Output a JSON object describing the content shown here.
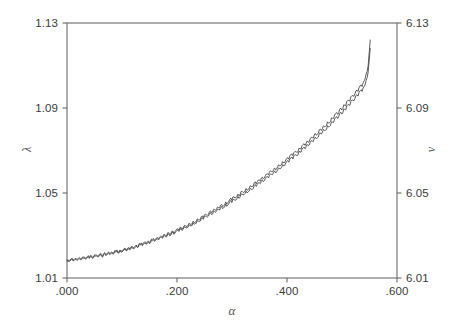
{
  "chart_data": {
    "type": "line",
    "title": "",
    "subtitle": "",
    "xlabel": "α",
    "ylabel": "λ",
    "ylabel_right": "ν",
    "xlim": [
      0.0,
      0.6
    ],
    "ylim": [
      1.01,
      1.13
    ],
    "ylim_right": [
      6.01,
      6.13
    ],
    "xticks": [
      0.0,
      0.2,
      0.4,
      0.6
    ],
    "xtick_labels": [
      ".000",
      ".200",
      ".400",
      ".600"
    ],
    "yticks": [
      1.01,
      1.05,
      1.09,
      1.13
    ],
    "ytick_labels": [
      "1.01",
      "1.05",
      "1.09",
      "1.13"
    ],
    "yticks_right": [
      6.01,
      6.05,
      6.09,
      6.13
    ],
    "ytick_labels_right": [
      "6.01",
      "6.05",
      "6.09",
      "6.13"
    ],
    "grid": false,
    "legend": "none",
    "line_color": "#4a4a4a",
    "axis_color": "#6b6b6b",
    "series": [
      {
        "name": "lambda-trace-upper",
        "x": [
          0.0,
          0.0037,
          0.0074,
          0.0111,
          0.0148,
          0.0185,
          0.0222,
          0.0259,
          0.0296,
          0.0333,
          0.037,
          0.0407,
          0.0444,
          0.0481,
          0.0518,
          0.0555,
          0.0592,
          0.0629,
          0.0666,
          0.0703,
          0.074,
          0.0777,
          0.0814,
          0.0851,
          0.0888,
          0.0925,
          0.0962,
          0.0999,
          0.1036,
          0.1073,
          0.111,
          0.1147,
          0.1184,
          0.1221,
          0.1258,
          0.1295,
          0.1332,
          0.1369,
          0.1406,
          0.1443,
          0.148,
          0.1517,
          0.1554,
          0.1591,
          0.1628,
          0.1665,
          0.1702,
          0.1739,
          0.1776,
          0.1813,
          0.185,
          0.1887,
          0.1924,
          0.1961,
          0.1998,
          0.2035,
          0.2072,
          0.2109,
          0.2146,
          0.2183,
          0.222,
          0.2257,
          0.2294,
          0.2331,
          0.2368,
          0.2405,
          0.2442,
          0.2479,
          0.2516,
          0.2553,
          0.259,
          0.2627,
          0.2664,
          0.2701,
          0.2738,
          0.2775,
          0.2812,
          0.2849,
          0.2886,
          0.2923,
          0.296,
          0.2997,
          0.3034,
          0.3071,
          0.3108,
          0.3145,
          0.3182,
          0.3219,
          0.3256,
          0.3293,
          0.333,
          0.3367,
          0.3404,
          0.3441,
          0.3478,
          0.3515,
          0.3552,
          0.3589,
          0.3626,
          0.3663,
          0.37,
          0.3737,
          0.3774,
          0.3811,
          0.3848,
          0.3885,
          0.3922,
          0.3959,
          0.3996,
          0.4033,
          0.407,
          0.4107,
          0.4144,
          0.4181,
          0.4218,
          0.4255,
          0.4292,
          0.4329,
          0.4366,
          0.4403,
          0.444,
          0.4477,
          0.4514,
          0.4551,
          0.4588,
          0.4625,
          0.4662,
          0.4699,
          0.4736,
          0.4773,
          0.481,
          0.4847,
          0.4884,
          0.4921,
          0.4958,
          0.4995,
          0.5032,
          0.5069,
          0.5106,
          0.5143,
          0.518,
          0.5217,
          0.5254,
          0.5291,
          0.5328,
          0.5365,
          0.5402,
          0.5439,
          0.5476,
          0.5513
        ],
        "values": [
          1.0185,
          1.0182,
          1.0189,
          1.0184,
          1.0192,
          1.0187,
          1.0196,
          1.019,
          1.0198,
          1.0193,
          1.0201,
          1.0196,
          1.0205,
          1.0199,
          1.0208,
          1.0203,
          1.0212,
          1.0206,
          1.0215,
          1.021,
          1.0219,
          1.0214,
          1.0223,
          1.0218,
          1.0227,
          1.0222,
          1.0232,
          1.0227,
          1.0237,
          1.0232,
          1.0243,
          1.0238,
          1.0249,
          1.0244,
          1.0255,
          1.025,
          1.0261,
          1.0257,
          1.0268,
          1.0263,
          1.0275,
          1.027,
          1.0282,
          1.0277,
          1.0289,
          1.0285,
          1.0297,
          1.0292,
          1.0305,
          1.03,
          1.0313,
          1.0308,
          1.0321,
          1.0317,
          1.033,
          1.0325,
          1.0339,
          1.0334,
          1.0348,
          1.0344,
          1.0358,
          1.0353,
          1.0368,
          1.0363,
          1.0378,
          1.0374,
          1.0389,
          1.0384,
          1.04,
          1.0395,
          1.0411,
          1.0407,
          1.0423,
          1.0418,
          1.0434,
          1.043,
          1.0446,
          1.0441,
          1.0458,
          1.0454,
          1.047,
          1.0466,
          1.0483,
          1.0478,
          1.0495,
          1.0491,
          1.0508,
          1.0503,
          1.0521,
          1.0517,
          1.0534,
          1.053,
          1.0548,
          1.0543,
          1.0561,
          1.0557,
          1.0575,
          1.0571,
          1.0589,
          1.0585,
          1.0604,
          1.0599,
          1.0618,
          1.0614,
          1.0633,
          1.0629,
          1.0648,
          1.0644,
          1.0663,
          1.0659,
          1.0679,
          1.0675,
          1.0695,
          1.0691,
          1.0711,
          1.0707,
          1.0728,
          1.0724,
          1.0745,
          1.0741,
          1.0762,
          1.0759,
          1.078,
          1.0776,
          1.0798,
          1.0794,
          1.0816,
          1.0813,
          1.0835,
          1.0831,
          1.0854,
          1.0851,
          1.0874,
          1.087,
          1.0894,
          1.0891,
          1.0915,
          1.0911,
          1.0936,
          1.0933,
          1.0958,
          1.0955,
          1.0981,
          1.0978,
          1.1004,
          1.1001,
          1.1028,
          1.106,
          1.11,
          1.122
        ]
      },
      {
        "name": "lambda-trace-lower",
        "x": [
          0.0,
          0.0037,
          0.0074,
          0.0111,
          0.0148,
          0.0185,
          0.0222,
          0.0259,
          0.0296,
          0.0333,
          0.037,
          0.0407,
          0.0444,
          0.0481,
          0.0518,
          0.0555,
          0.0592,
          0.0629,
          0.0666,
          0.0703,
          0.074,
          0.0777,
          0.0814,
          0.0851,
          0.0888,
          0.0925,
          0.0962,
          0.0999,
          0.1036,
          0.1073,
          0.111,
          0.1147,
          0.1184,
          0.1221,
          0.1258,
          0.1295,
          0.1332,
          0.1369,
          0.1406,
          0.1443,
          0.148,
          0.1517,
          0.1554,
          0.1591,
          0.1628,
          0.1665,
          0.1702,
          0.1739,
          0.1776,
          0.1813,
          0.185,
          0.1887,
          0.1924,
          0.1961,
          0.1998,
          0.2035,
          0.2072,
          0.2109,
          0.2146,
          0.2183,
          0.222,
          0.2257,
          0.2294,
          0.2331,
          0.2368,
          0.2405,
          0.2442,
          0.2479,
          0.2516,
          0.2553,
          0.259,
          0.2627,
          0.2664,
          0.2701,
          0.2738,
          0.2775,
          0.2812,
          0.2849,
          0.2886,
          0.2923,
          0.296,
          0.2997,
          0.3034,
          0.3071,
          0.3108,
          0.3145,
          0.3182,
          0.3219,
          0.3256,
          0.3293,
          0.333,
          0.3367,
          0.3404,
          0.3441,
          0.3478,
          0.3515,
          0.3552,
          0.3589,
          0.3626,
          0.3663,
          0.37,
          0.3737,
          0.3774,
          0.3811,
          0.3848,
          0.3885,
          0.3922,
          0.3959,
          0.3996,
          0.4033,
          0.407,
          0.4107,
          0.4144,
          0.4181,
          0.4218,
          0.4255,
          0.4292,
          0.4329,
          0.4366,
          0.4403,
          0.444,
          0.4477,
          0.4514,
          0.4551,
          0.4588,
          0.4625,
          0.4662,
          0.4699,
          0.4736,
          0.4773,
          0.481,
          0.4847,
          0.4884,
          0.4921,
          0.4958,
          0.4995,
          0.5032,
          0.5069,
          0.5106,
          0.5143,
          0.518,
          0.5217,
          0.5254,
          0.5291,
          0.5328,
          0.5365,
          0.5402,
          0.5439,
          0.5476,
          0.5513
        ],
        "values": [
          1.018,
          1.0178,
          1.0184,
          1.018,
          1.0187,
          1.0183,
          1.0191,
          1.0186,
          1.0193,
          1.0189,
          1.0196,
          1.0192,
          1.02,
          1.0195,
          1.0203,
          1.0199,
          1.0207,
          1.0202,
          1.021,
          1.0206,
          1.0214,
          1.021,
          1.0218,
          1.0214,
          1.0222,
          1.0218,
          1.0227,
          1.0222,
          1.0232,
          1.0228,
          1.0238,
          1.0233,
          1.0244,
          1.0239,
          1.025,
          1.0245,
          1.0256,
          1.0252,
          1.0262,
          1.0258,
          1.0269,
          1.0265,
          1.0276,
          1.0272,
          1.0284,
          1.0279,
          1.0291,
          1.0287,
          1.0299,
          1.0294,
          1.0307,
          1.0302,
          1.0315,
          1.0311,
          1.0323,
          1.0319,
          1.0332,
          1.0328,
          1.0341,
          1.0337,
          1.0351,
          1.0346,
          1.036,
          1.0356,
          1.037,
          1.0366,
          1.0381,
          1.0376,
          1.0391,
          1.0387,
          1.0402,
          1.0398,
          1.0413,
          1.0409,
          1.0425,
          1.042,
          1.0436,
          1.0432,
          1.0448,
          1.0443,
          1.0459,
          1.0455,
          1.0471,
          1.0467,
          1.0484,
          1.0479,
          1.0496,
          1.0492,
          1.0509,
          1.0505,
          1.0522,
          1.0517,
          1.0535,
          1.0531,
          1.0548,
          1.0544,
          1.0562,
          1.0558,
          1.0576,
          1.0571,
          1.059,
          1.0586,
          1.0604,
          1.06,
          1.0619,
          1.0615,
          1.0634,
          1.063,
          1.0649,
          1.0645,
          1.0664,
          1.066,
          1.068,
          1.0676,
          1.0696,
          1.0692,
          1.0712,
          1.0708,
          1.0729,
          1.0725,
          1.0746,
          1.0742,
          1.0763,
          1.0759,
          1.0781,
          1.0777,
          1.0799,
          1.0795,
          1.0817,
          1.0813,
          1.0836,
          1.0832,
          1.0855,
          1.0851,
          1.0875,
          1.0871,
          1.0895,
          1.0891,
          1.0916,
          1.0912,
          1.0937,
          1.0934,
          1.0959,
          1.0956,
          1.0981,
          1.0978,
          1.1002,
          1.103,
          1.107,
          1.118
        ]
      }
    ]
  },
  "axes": {
    "x_title": "α",
    "y_title_left": "λ",
    "y_title_right": "ν"
  }
}
